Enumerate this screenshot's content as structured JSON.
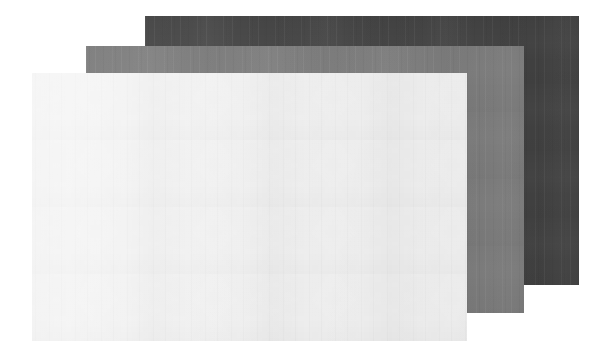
{
  "scene": {
    "title": "Stacked paper sheets",
    "description": "Three overlapping rectangular paper sheets of differing tone, stacked in a diagonal cascade on a white background.",
    "background_color": "#ffffff",
    "width": 612,
    "height": 359
  },
  "sheets": [
    {
      "id": "sheet-dark",
      "name": "dark-sheet",
      "label": "Dark sheet",
      "stack_order": "back",
      "z_index": 1,
      "color": "#424242",
      "texture": "vertical-fibre-streaks",
      "x": 145,
      "y": 16,
      "width": 434,
      "height": 269
    },
    {
      "id": "sheet-gray",
      "name": "gray-sheet",
      "label": "Mid gray sheet",
      "stack_order": "middle",
      "z_index": 2,
      "color": "#7d7d7d",
      "texture": "vertical-fibre-streaks",
      "x": 86,
      "y": 46,
      "width": 438,
      "height": 267
    },
    {
      "id": "sheet-light",
      "name": "light-sheet",
      "label": "Light sheet",
      "stack_order": "front",
      "z_index": 3,
      "color": "#efefef",
      "texture": "vertical-fibre-streaks",
      "x": 32,
      "y": 73,
      "width": 435,
      "height": 268
    }
  ]
}
